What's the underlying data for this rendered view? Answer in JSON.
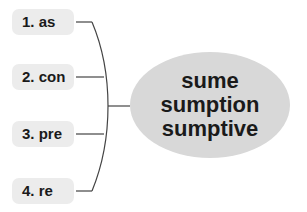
{
  "prefixes": [
    {
      "label": "1. as"
    },
    {
      "label": "2. con"
    },
    {
      "label": "3. pre"
    },
    {
      "label": "4. re"
    }
  ],
  "root": {
    "lines": [
      "sume",
      "sumption",
      "sumptive"
    ]
  },
  "colors": {
    "box": "#ececec",
    "ellipse": "#d8d8d8",
    "line": "#444444",
    "text": "#1a1a1a"
  }
}
